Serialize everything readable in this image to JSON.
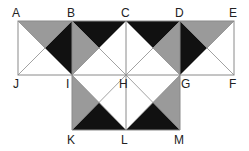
{
  "diagram": {
    "colors": {
      "gray": "#9a9a9a",
      "black": "#111111",
      "line": "#8a8a8a"
    },
    "points": {
      "A": [
        18,
        21
      ],
      "B": [
        72,
        21
      ],
      "C": [
        126,
        21
      ],
      "D": [
        180,
        21
      ],
      "E": [
        234,
        21
      ],
      "J": [
        18,
        75
      ],
      "I": [
        72,
        75
      ],
      "H": [
        126,
        75
      ],
      "G": [
        180,
        75
      ],
      "F": [
        234,
        75
      ],
      "K": [
        72,
        130
      ],
      "L": [
        126,
        130
      ],
      "M": [
        180,
        130
      ]
    },
    "labels": {
      "A": "A",
      "B": "B",
      "C": "C",
      "D": "D",
      "E": "E",
      "J": "J",
      "I": "I",
      "H": "H",
      "G": "G",
      "F": "F",
      "K": "K",
      "L": "L",
      "M": "M"
    },
    "squares": [
      "ABIJ",
      "BCHI",
      "CDGH",
      "DEFG",
      "IHLK",
      "HGML"
    ],
    "shaded_triangles": [
      {
        "square": "ABIJ",
        "side": "AB",
        "fill": "gray"
      },
      {
        "square": "ABIJ",
        "side": "BI",
        "fill": "black"
      },
      {
        "square": "BCHI",
        "side": "BC",
        "fill": "black"
      },
      {
        "square": "BCHI",
        "side": "BI",
        "fill": "gray"
      },
      {
        "square": "CDGH",
        "side": "CD",
        "fill": "black"
      },
      {
        "square": "CDGH",
        "side": "DG",
        "fill": "gray"
      },
      {
        "square": "DEFG",
        "side": "DE",
        "fill": "gray"
      },
      {
        "square": "DEFG",
        "side": "DG",
        "fill": "black"
      },
      {
        "square": "IHLK",
        "side": "IK",
        "fill": "gray"
      },
      {
        "square": "IHLK",
        "side": "KL",
        "fill": "black"
      },
      {
        "square": "HGML",
        "side": "GM",
        "fill": "gray"
      },
      {
        "square": "HGML",
        "side": "LM",
        "fill": "black"
      }
    ]
  }
}
